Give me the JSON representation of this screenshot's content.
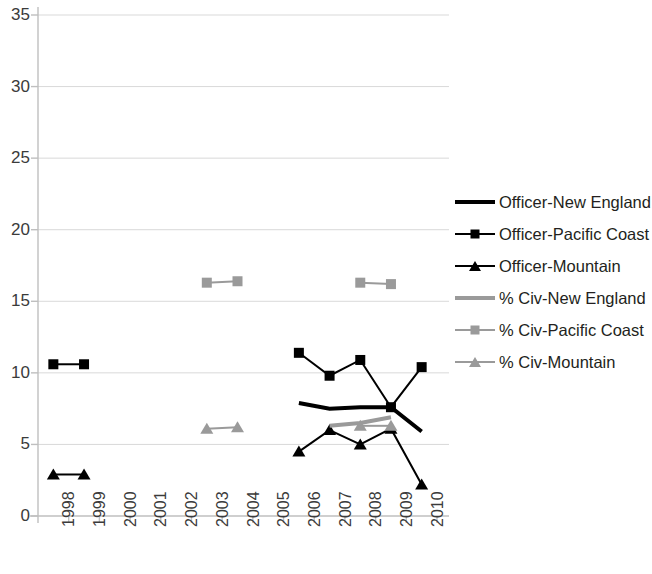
{
  "chart_data": {
    "type": "line",
    "title": "",
    "xlabel": "",
    "ylabel": "",
    "x": [
      1998,
      1999,
      2000,
      2001,
      2002,
      2003,
      2004,
      2005,
      2006,
      2007,
      2008,
      2009,
      2010
    ],
    "x_tick_labels": [
      "1998",
      "1999",
      "2000",
      "2001",
      "2002",
      "2003",
      "2004",
      "2005",
      "2006",
      "2007",
      "2008",
      "2009",
      "2010"
    ],
    "y_tick_labels": [
      "0",
      "5",
      "10",
      "15",
      "20",
      "25",
      "30",
      "35"
    ],
    "y_ticks": [
      0,
      5,
      10,
      15,
      20,
      25,
      30,
      35
    ],
    "ylim": [
      0,
      35
    ],
    "grid": "horizontal",
    "legend_position": "right",
    "series": [
      {
        "name": "Officer-New England",
        "color": "#000000",
        "marker": "none",
        "line_width": 4,
        "x": [
          2006,
          2007,
          2008,
          2009,
          2010
        ],
        "values": [
          7.9,
          7.5,
          7.6,
          7.6,
          5.9
        ]
      },
      {
        "name": "Officer-Pacific Coast",
        "color": "#000000",
        "marker": "square",
        "line_width": 2,
        "x": [
          1998,
          1999,
          2006,
          2007,
          2008,
          2009,
          2010
        ],
        "values": [
          10.6,
          10.6,
          11.4,
          9.8,
          10.9,
          7.6,
          10.4
        ]
      },
      {
        "name": "Officer-Mountain",
        "color": "#000000",
        "marker": "triangle",
        "line_width": 2,
        "x": [
          1998,
          1999,
          2006,
          2007,
          2008,
          2009,
          2010
        ],
        "values": [
          2.9,
          2.9,
          4.5,
          6.0,
          5.0,
          6.1,
          2.2
        ]
      },
      {
        "name": "% Civ-New England",
        "color": "#9a9a9a",
        "marker": "none",
        "line_width": 4,
        "x": [
          2007,
          2008,
          2009
        ],
        "values": [
          6.3,
          6.5,
          6.9
        ]
      },
      {
        "name": "% Civ-Pacific Coast",
        "color": "#9a9a9a",
        "marker": "square",
        "line_width": 2,
        "x": [
          2003,
          2004,
          2008,
          2009
        ],
        "values": [
          16.3,
          16.4,
          16.3,
          16.2
        ]
      },
      {
        "name": "% Civ-Mountain",
        "color": "#9a9a9a",
        "marker": "triangle",
        "line_width": 2,
        "x": [
          2003,
          2004,
          2008,
          2009
        ],
        "values": [
          6.1,
          6.2,
          6.3,
          6.3
        ]
      }
    ],
    "segments": [
      {
        "series": "Officer-Pacific Coast",
        "x": [
          1998,
          1999
        ]
      },
      {
        "series": "Officer-Pacific Coast",
        "x": [
          2006,
          2007,
          2008,
          2009,
          2010
        ]
      },
      {
        "series": "Officer-Mountain",
        "x": [
          1998,
          1999
        ]
      },
      {
        "series": "Officer-Mountain",
        "x": [
          2006,
          2007,
          2008,
          2009,
          2010
        ]
      },
      {
        "series": "% Civ-Pacific Coast",
        "x": [
          2003,
          2004
        ]
      },
      {
        "series": "% Civ-Pacific Coast",
        "x": [
          2008,
          2009
        ]
      },
      {
        "series": "% Civ-Mountain",
        "x": [
          2003,
          2004
        ]
      },
      {
        "series": "% Civ-Mountain",
        "x": [
          2008,
          2009
        ]
      },
      {
        "series": "% Civ-New England",
        "x": [
          2007,
          2008,
          2009
        ]
      },
      {
        "series": "Officer-New England",
        "x": [
          2006,
          2007,
          2008,
          2009,
          2010
        ]
      }
    ],
    "colors": {
      "officer": "#000000",
      "civilian": "#9a9a9a",
      "grid": "#d9d9d9",
      "axis": "#bfbfbf",
      "text": "#3b3b3b"
    }
  },
  "legend": {
    "items": [
      {
        "label": "Officer-New England",
        "key": "thick-black-line",
        "marker": "none"
      },
      {
        "label": "Officer-Pacific Coast",
        "key": "black-line-square",
        "marker": "square"
      },
      {
        "label": "Officer-Mountain",
        "key": "black-line-triangle",
        "marker": "triangle"
      },
      {
        "label": "% Civ-New England",
        "key": "thick-gray-line",
        "marker": "none"
      },
      {
        "label": "% Civ-Pacific Coast",
        "key": "gray-line-square",
        "marker": "square"
      },
      {
        "label": "% Civ-Mountain",
        "key": "gray-line-triangle",
        "marker": "triangle"
      }
    ]
  }
}
